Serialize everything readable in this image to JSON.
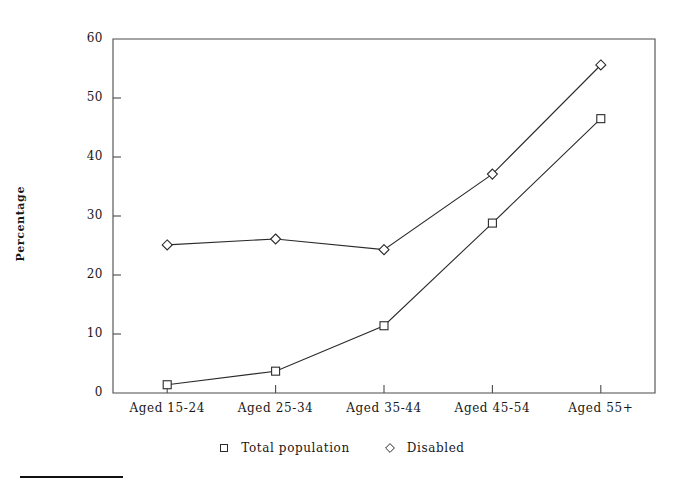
{
  "figure": {
    "axis_y_title": "Percentage",
    "plot": {
      "left": 113,
      "top": 39,
      "right": 655,
      "bottom": 393
    },
    "footnote_rule": true
  },
  "chart_data": {
    "type": "line",
    "title": "",
    "xlabel": "",
    "ylabel": "Percentage",
    "ylim": [
      0,
      60
    ],
    "ytick_values": [
      0,
      10,
      20,
      30,
      40,
      50,
      60
    ],
    "ytick_labels": [
      "0",
      "10",
      "20",
      "30",
      "40",
      "50",
      "60"
    ],
    "grid": false,
    "legend_position": "bottom-center",
    "categories": [
      "Aged 15-24",
      "Aged 25-34",
      "Aged 35-44",
      "Aged 45-54",
      "Aged 55+"
    ],
    "series": [
      {
        "name": "Total population",
        "marker": "open-square",
        "values": [
          1.4,
          3.7,
          11.4,
          28.8,
          46.5
        ]
      },
      {
        "name": "Disabled",
        "marker": "open-diamond",
        "values": [
          25.1,
          26.1,
          24.3,
          37.1,
          55.6
        ]
      }
    ],
    "colors": {
      "line": "#2b2b2b",
      "marker_fill": "#ffffff",
      "axis": "#4a4a4a"
    }
  }
}
